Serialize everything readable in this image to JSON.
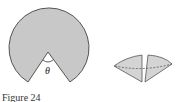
{
  "figure": {
    "caption": "Figure 24",
    "angle_label": "θ",
    "sector_fill": "#c8c8c8",
    "stroke_color": "#555555",
    "dashed_color": "#555555"
  }
}
